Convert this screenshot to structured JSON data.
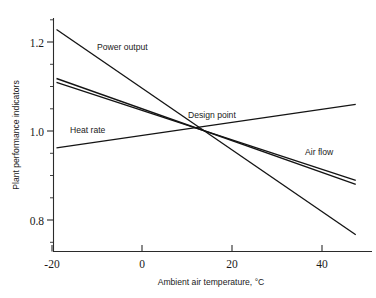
{
  "chart_data": {
    "type": "line",
    "title": "",
    "xlabel": "Ambient air temperature, °C",
    "ylabel": "Plant performance indicators",
    "xlim": [
      -22,
      48
    ],
    "ylim": [
      0.73,
      1.25
    ],
    "xticks": [
      -20,
      0,
      20,
      40
    ],
    "xtick_labels": [
      "-20",
      "0",
      "20",
      "40"
    ],
    "yticks": [
      0.8,
      1.0,
      1.2
    ],
    "ytick_labels": [
      "0.8",
      "1.0",
      "1.2"
    ],
    "y_minor_ticks": [
      0.75,
      0.85,
      0.9,
      0.95,
      1.05,
      1.1,
      1.15,
      1.25
    ],
    "grid": false,
    "legend_position": "inline-annotations",
    "design_point": {
      "x": 14.0,
      "y": 1.0,
      "label": "Design point"
    },
    "series": [
      {
        "name": "Power output",
        "label": "Power output",
        "x": [
          -19.0,
          47.5
        ],
        "y": [
          1.228,
          0.767
        ],
        "label_x": 8.0,
        "label_y": 1.178
      },
      {
        "name": "Heat rate",
        "label": "Heat rate",
        "x": [
          -19.0,
          47.5
        ],
        "y": [
          0.962,
          1.06
        ],
        "label_x": -12.0,
        "label_y": 1.008
      },
      {
        "name": "Air flow",
        "label": "Air flow",
        "x": [
          -19.0,
          47.5
        ],
        "y": [
          1.118,
          0.889
        ],
        "label_x": 33.5,
        "label_y": 0.948
      },
      {
        "name": "Unlabeled indicator",
        "label": "",
        "x": [
          -19.0,
          47.5
        ],
        "y": [
          1.118,
          0.889
        ],
        "label_x": 0,
        "label_y": 0
      }
    ]
  },
  "figure": {
    "background_color": "#ffffff",
    "line_color": "#141414",
    "axis_color": "#2b2b2b"
  }
}
